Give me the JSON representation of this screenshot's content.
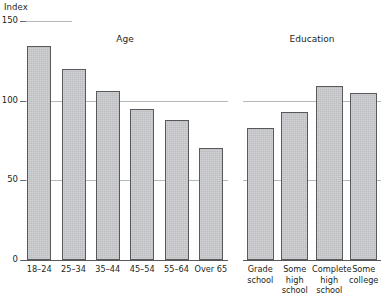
{
  "chart_data": {
    "type": "bar",
    "title": "",
    "xlabel": "",
    "ylabel": "Index",
    "ylim": [
      0,
      150
    ],
    "yticks": [
      0,
      50,
      100,
      150
    ],
    "ytick_labels": [
      "0",
      "50",
      "100",
      "150"
    ],
    "grid": true,
    "gridlines_at": [
      50,
      100,
      150
    ],
    "legend": "none",
    "panels": [
      {
        "name": "age-panel",
        "title": "Age",
        "categories": [
          "18–24",
          "25–34",
          "35–44",
          "45–54",
          "55–64",
          "Over 65"
        ],
        "category_lines": [
          [
            "18–24"
          ],
          [
            "25–34"
          ],
          [
            "35–44"
          ],
          [
            "45–54"
          ],
          [
            "55–64"
          ],
          [
            "Over 65"
          ]
        ],
        "values": [
          134,
          120,
          106,
          95,
          88,
          70
        ]
      },
      {
        "name": "education-panel",
        "title": "Education",
        "categories": [
          "Grade school",
          "Some high school",
          "Complete high school",
          "Some college"
        ],
        "category_lines": [
          [
            "Grade",
            "school"
          ],
          [
            "Some",
            "high",
            "school"
          ],
          [
            "Complete",
            "high",
            "school"
          ],
          [
            "Some",
            "college"
          ]
        ],
        "values": [
          83,
          93,
          109,
          105
        ]
      }
    ],
    "colors": {
      "bar_fill": "#bcbdc0",
      "bar_stroke": "#58595b",
      "gridline": "#b5b7b9",
      "axis": "#58595b",
      "text": "#231f20",
      "background": "#ffffff"
    }
  }
}
